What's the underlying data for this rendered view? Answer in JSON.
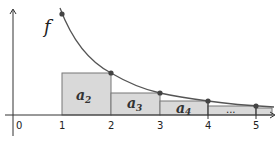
{
  "diagram": {
    "function_label": "f",
    "origin_label": "0",
    "x_ticks": [
      {
        "value": 1,
        "label": "1",
        "x": 62
      },
      {
        "value": 2,
        "label": "2",
        "x": 111
      },
      {
        "value": 3,
        "label": "3",
        "x": 160
      },
      {
        "value": 4,
        "label": "4",
        "x": 208
      },
      {
        "value": 5,
        "label": "5",
        "x": 256
      }
    ],
    "rectangles": [
      {
        "base": "a",
        "sub": "2",
        "from": 1,
        "to": 2
      },
      {
        "base": "a",
        "sub": "3",
        "from": 2,
        "to": 3
      },
      {
        "base": "a",
        "sub": "4",
        "from": 3,
        "to": 4
      },
      {
        "label": "...",
        "from": 4,
        "to": 5
      }
    ],
    "colors": {
      "curve": "#555555",
      "rect_fill": "#d9d9d9",
      "rect_stroke": "#777777",
      "axis": "#333333",
      "point": "#444444"
    }
  }
}
